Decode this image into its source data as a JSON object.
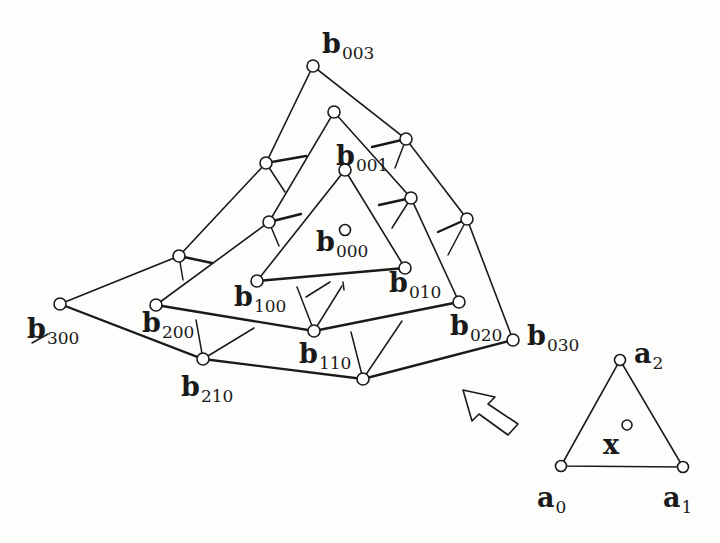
{
  "figure": {
    "colors": {
      "ink": "#1a1a1a",
      "background": "#fdfdfb",
      "node_fill": "#ffffff"
    }
  },
  "control_net": {
    "labeled_points": [
      {
        "id": "b003",
        "base": "b",
        "sub": "003",
        "x": 313,
        "y": 66,
        "label_x": 322,
        "label_y": 30
      },
      {
        "id": "b001",
        "base": "b",
        "sub": "001",
        "x": 345,
        "y": 170,
        "label_x": 336,
        "label_y": 142
      },
      {
        "id": "b000",
        "base": "b",
        "sub": "000",
        "x": 345,
        "y": 230,
        "label_x": 316,
        "label_y": 228
      },
      {
        "id": "b100",
        "base": "b",
        "sub": "100",
        "x": 257,
        "y": 281,
        "label_x": 234,
        "label_y": 283
      },
      {
        "id": "b010",
        "base": "b",
        "sub": "010",
        "x": 405,
        "y": 268,
        "label_x": 389,
        "label_y": 269
      },
      {
        "id": "b300",
        "base": "b",
        "sub": "300",
        "x": 60,
        "y": 304,
        "label_x": 27,
        "label_y": 315
      },
      {
        "id": "b200",
        "base": "b",
        "sub": "200",
        "x": 156,
        "y": 305,
        "label_x": 142,
        "label_y": 309
      },
      {
        "id": "b110",
        "base": "b",
        "sub": "110",
        "x": 314,
        "y": 331,
        "label_x": 299,
        "label_y": 340
      },
      {
        "id": "b020",
        "base": "b",
        "sub": "020",
        "x": 459,
        "y": 302,
        "label_x": 450,
        "label_y": 312
      },
      {
        "id": "b030",
        "base": "b",
        "sub": "030",
        "x": 513,
        "y": 340,
        "label_x": 527,
        "label_y": 322
      },
      {
        "id": "b210",
        "base": "b",
        "sub": "210",
        "x": 203,
        "y": 359,
        "label_x": 181,
        "label_y": 373
      }
    ],
    "unlabeled_points": [
      {
        "id": "p_top_mid",
        "x": 266,
        "y": 163
      },
      {
        "id": "p_right_top",
        "x": 406,
        "y": 139
      },
      {
        "id": "p_mid_top",
        "x": 334,
        "y": 112
      },
      {
        "id": "p_left_mid",
        "x": 269,
        "y": 222
      },
      {
        "id": "p_right_mid",
        "x": 411,
        "y": 198
      },
      {
        "id": "p_far_right",
        "x": 467,
        "y": 219
      },
      {
        "id": "p_left_low",
        "x": 179,
        "y": 256
      },
      {
        "id": "p_bottom",
        "x": 363,
        "y": 379
      }
    ]
  },
  "domain_triangle": {
    "points": [
      {
        "id": "a0",
        "base": "a",
        "sub": "0",
        "x": 561,
        "y": 466,
        "label_x": 537,
        "label_y": 484
      },
      {
        "id": "a1",
        "base": "a",
        "sub": "1",
        "x": 683,
        "y": 467,
        "label_x": 663,
        "label_y": 484
      },
      {
        "id": "a2",
        "base": "a",
        "sub": "2",
        "x": 620,
        "y": 360,
        "label_x": 634,
        "label_y": 340
      }
    ],
    "x_point": {
      "id": "x",
      "base": "x",
      "x": 627,
      "y": 425,
      "label_x": 603,
      "label_y": 431
    }
  },
  "arrow": {
    "direction": "up-left",
    "from": [
      513,
      425
    ],
    "to": [
      463,
      390
    ]
  }
}
